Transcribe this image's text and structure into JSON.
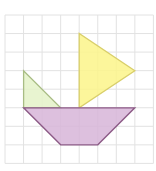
{
  "diagram": {
    "grid": {
      "origin_x": 5,
      "origin_y": 15,
      "cell": 18.55,
      "cols": 8,
      "rows": 8,
      "line_color": "#e2e2e2"
    },
    "shapes": [
      {
        "name": "green-triangle",
        "fill": "#e4f2c8",
        "stroke": "#a8bc84",
        "points_grid": [
          [
            1,
            3
          ],
          [
            1,
            5
          ],
          [
            3,
            5
          ]
        ]
      },
      {
        "name": "yellow-triangle",
        "fill": "#fbf48a",
        "stroke": "#d9cf6a",
        "points_grid": [
          [
            4,
            1
          ],
          [
            4,
            5
          ],
          [
            7,
            3
          ]
        ]
      },
      {
        "name": "purple-trapezoid",
        "fill": "#d7b5d8",
        "stroke": "#8c5a86",
        "points_grid": [
          [
            1,
            5
          ],
          [
            7,
            5
          ],
          [
            5,
            7
          ],
          [
            3,
            7
          ]
        ]
      }
    ]
  }
}
